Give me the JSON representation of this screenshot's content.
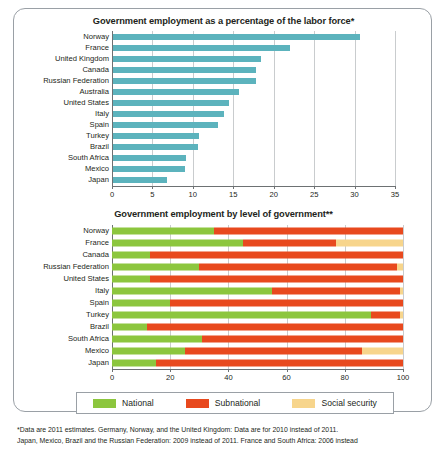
{
  "colors": {
    "teal": "#5cb3bd",
    "national": "#8cc63e",
    "subnational": "#e8491e",
    "social_security": "#f7d58c",
    "grid": "#c9ccce",
    "axis": "#6d7173",
    "frame": "#9aa0a6",
    "text": "#231f20"
  },
  "legend": {
    "items": [
      {
        "label": "National",
        "color_key": "national"
      },
      {
        "label": "Subnational",
        "color_key": "subnational"
      },
      {
        "label": "Social security",
        "color_key": "social_security"
      }
    ]
  },
  "footnote": {
    "line1": "*Data are 2011 estimates. Germany, Norway, and the United Kingdom: Data are for 2010 instead of 2011.",
    "line2": "Japan, Mexico, Brazil and the Russian Federation: 2009 instead of 2011. France and South Africa: 2006 instead"
  },
  "chart_data": [
    {
      "id": "top",
      "type": "bar",
      "orientation": "horizontal",
      "title": "Government employment as a percentage of the labor force*",
      "xlabel": "",
      "ylabel": "",
      "xlim": [
        0,
        35
      ],
      "xticks": [
        0,
        5,
        10,
        15,
        20,
        25,
        30,
        35
      ],
      "xtick_labels": [
        "0",
        "5",
        "10",
        "15",
        "20",
        "25",
        "30",
        "35"
      ],
      "grid": true,
      "legend_position": "none",
      "series_color": "#5cb3bd",
      "categories": [
        "Norway",
        "France",
        "United Kingdom",
        "Canada",
        "Russian Federation",
        "Australia",
        "United States",
        "Italy",
        "Spain",
        "Turkey",
        "Brazil",
        "South Africa",
        "Mexico",
        "Japan"
      ],
      "values": [
        30.6,
        21.9,
        18.3,
        17.7,
        17.7,
        15.6,
        14.3,
        13.7,
        13.0,
        10.6,
        10.5,
        9.0,
        8.9,
        6.7
      ]
    },
    {
      "id": "bottom",
      "type": "bar",
      "orientation": "horizontal",
      "stacked": true,
      "title": "Government employment by level of government**",
      "xlabel": "",
      "ylabel": "",
      "xlim": [
        0,
        100
      ],
      "xticks": [
        0,
        20,
        40,
        60,
        80,
        100
      ],
      "xtick_labels": [
        "0",
        "20",
        "40",
        "60",
        "80",
        "100"
      ],
      "grid": true,
      "legend_position": "bottom",
      "categories": [
        "Norway",
        "France",
        "Canada",
        "Russian Federation",
        "United States",
        "Italy",
        "Spain",
        "Turkey",
        "Brazil",
        "South Africa",
        "Mexico",
        "Japan"
      ],
      "series": [
        {
          "name": "National",
          "color": "#8cc63e",
          "values": [
            35,
            45,
            13,
            30,
            13,
            55,
            20,
            89,
            12,
            31,
            25,
            15
          ]
        },
        {
          "name": "Subnational",
          "color": "#e8491e",
          "values": [
            65,
            32,
            87,
            68,
            87,
            44,
            80,
            10,
            88,
            69,
            61,
            85
          ]
        },
        {
          "name": "Social security",
          "color": "#f7d58c",
          "values": [
            0,
            23,
            0,
            2,
            0,
            1,
            0,
            1,
            0,
            0,
            14,
            0
          ]
        }
      ]
    }
  ]
}
